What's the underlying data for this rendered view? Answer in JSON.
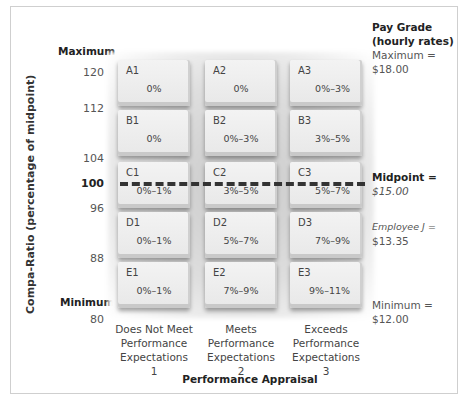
{
  "chart_data": {
    "type": "table",
    "ylabel": "Compa-Ratio (percentage of midpoint)",
    "xlabel": "Performance Appraisal",
    "y_ticks": [
      "120",
      "112",
      "104",
      "100",
      "96",
      "88",
      "80"
    ],
    "y_end_labels": {
      "max": "Maximum",
      "min": "Minimum"
    },
    "columns": [
      {
        "label": [
          "Does Not Meet",
          "Performance",
          "Expectations",
          "1"
        ]
      },
      {
        "label": [
          "Meets",
          "Performance",
          "Expectations",
          "2"
        ]
      },
      {
        "label": [
          "Exceeds",
          "Performance",
          "Expectations",
          "3"
        ]
      }
    ],
    "rows": [
      {
        "cells": [
          {
            "code": "A1",
            "rate": "0%"
          },
          {
            "code": "A2",
            "rate": "0%"
          },
          {
            "code": "A3",
            "rate": "0%–3%"
          }
        ]
      },
      {
        "cells": [
          {
            "code": "B1",
            "rate": "0%"
          },
          {
            "code": "B2",
            "rate": "0%–3%"
          },
          {
            "code": "B3",
            "rate": "3%–5%"
          }
        ]
      },
      {
        "cells": [
          {
            "code": "C1",
            "rate": "0%–1%"
          },
          {
            "code": "C2",
            "rate": "3%–5%"
          },
          {
            "code": "C3",
            "rate": "5%–7%"
          }
        ]
      },
      {
        "cells": [
          {
            "code": "D1",
            "rate": "0%–1%"
          },
          {
            "code": "D2",
            "rate": "5%–7%"
          },
          {
            "code": "D3",
            "rate": "7%–9%"
          }
        ]
      },
      {
        "cells": [
          {
            "code": "E1",
            "rate": "0%–1%"
          },
          {
            "code": "E2",
            "rate": "7%–9%"
          },
          {
            "code": "E3",
            "rate": "9%–11%"
          }
        ]
      }
    ],
    "midpoint_line": "100"
  },
  "side": {
    "title1": "Pay Grade",
    "title2": "(hourly rates)",
    "max_label": "Maximum =",
    "max_value": "$18.00",
    "mid_label": "Midpoint =",
    "mid_value": "$15.00",
    "emp_label": "Employee J =",
    "emp_value": "$13.35",
    "min_label": "Minimum =",
    "min_value": "$12.00"
  }
}
